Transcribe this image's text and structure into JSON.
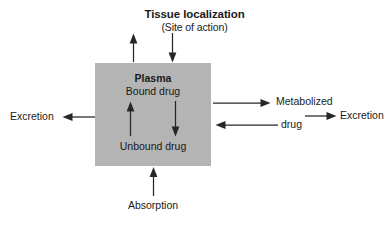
{
  "diagram": {
    "type": "flow",
    "title": "Tissue localization",
    "subtitle": "(Site of action)",
    "background_color": "#ffffff",
    "compartment": {
      "name": "Plasma",
      "fill_color": "#b4b4b4",
      "contents": [
        "Bound drug",
        "Unbound drug"
      ],
      "bound_label": "Bound drug",
      "unbound_label": "Unbound drug"
    },
    "nodes": {
      "excretion_left": "Excretion",
      "metabolized": "Metabolized",
      "drug": "drug",
      "excretion_right": "Excretion",
      "absorption": "Absorption"
    },
    "arrows": [
      {
        "name": "plasma-to-tissue",
        "direction": "up",
        "from": "Plasma",
        "to": "Tissue localization"
      },
      {
        "name": "tissue-to-plasma",
        "direction": "down",
        "from": "Tissue localization",
        "to": "Plasma"
      },
      {
        "name": "unbound-to-bound",
        "direction": "up",
        "from": "Unbound drug",
        "to": "Bound drug"
      },
      {
        "name": "bound-to-unbound",
        "direction": "down",
        "from": "Bound drug",
        "to": "Unbound drug"
      },
      {
        "name": "plasma-to-excretion-left",
        "direction": "left",
        "from": "Plasma",
        "to": "Excretion"
      },
      {
        "name": "plasma-to-metabolized",
        "direction": "right",
        "from": "Plasma",
        "to": "Metabolized drug"
      },
      {
        "name": "metabolized-to-plasma",
        "direction": "left",
        "from": "Metabolized drug",
        "to": "Plasma"
      },
      {
        "name": "metabolized-to-excretion-right",
        "direction": "right",
        "from": "Metabolized drug",
        "to": "Excretion"
      },
      {
        "name": "absorption-to-plasma",
        "direction": "up",
        "from": "Absorption",
        "to": "Plasma"
      }
    ]
  }
}
